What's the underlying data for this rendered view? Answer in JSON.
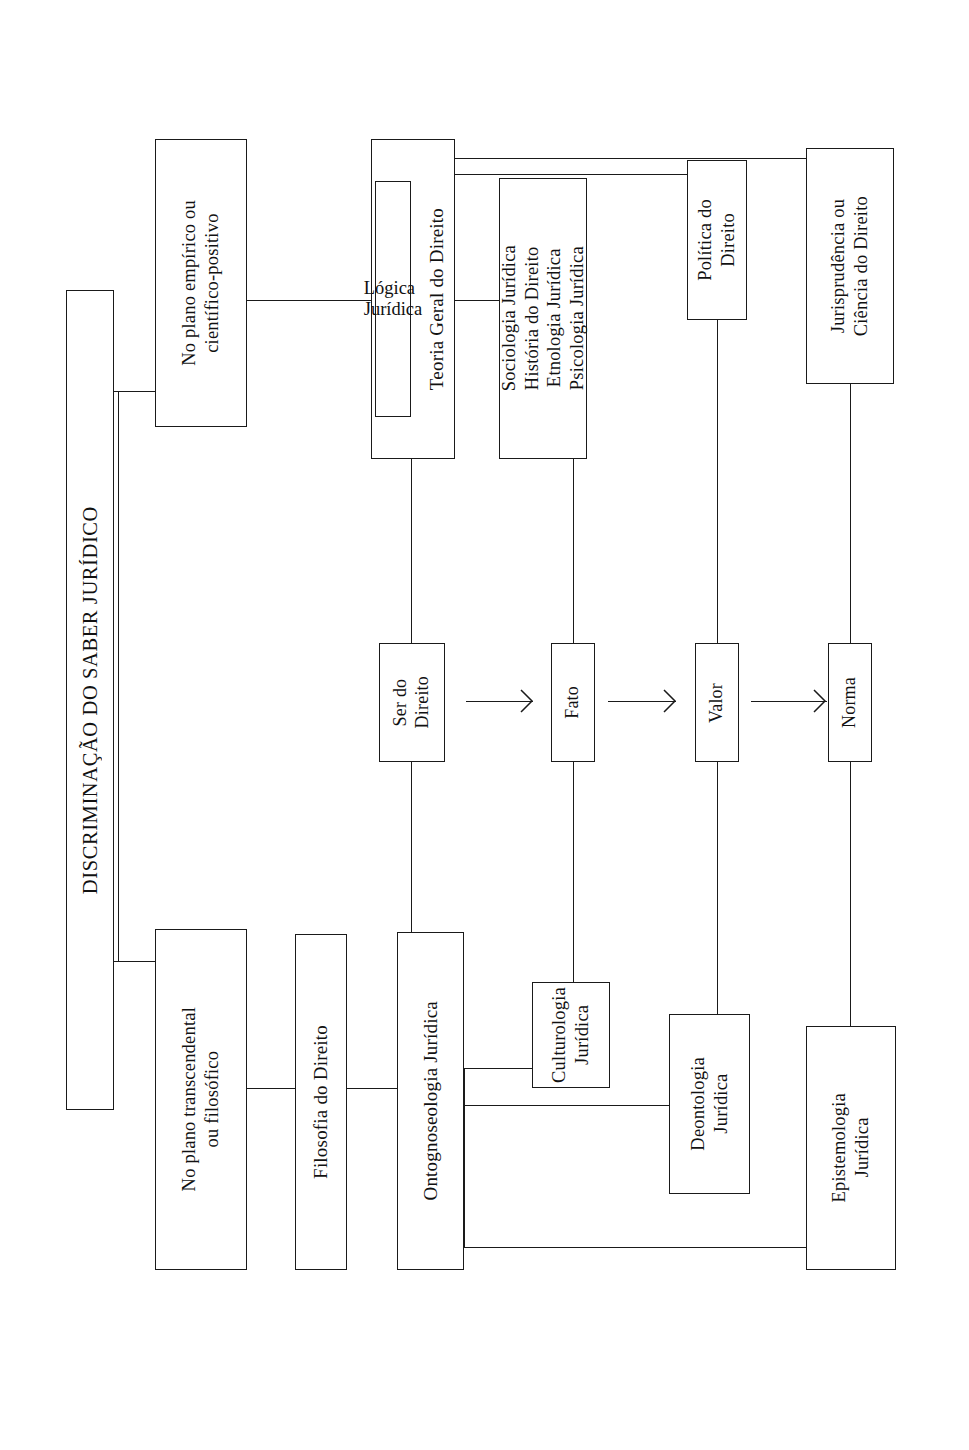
{
  "diagram": {
    "title": "DISCRIMINAÇÃO DO SABER JURÍDICO",
    "orientation": "rotated-90-ccw",
    "nodes": {
      "root": "DISCRIMINAÇÃO DO SABER JURÍDICO",
      "plano_empirico": "No plano empírico ou\ncientífico-positivo",
      "plano_transcendental": "No plano transcendental\nou filosófico",
      "logica_juridica": "Lógica Jurídica",
      "teoria_geral": "Teoria Geral do Direito",
      "ciencias_juridicas": "Sociologia Jurídica\nHistória do Direito\nEtnologia Jurídica\nPsicologia Jurídica",
      "politica_direito": "Política do\nDireito",
      "jurisprudencia": "Jurisprudência ou\nCiência do Direito",
      "filosofia_direito": "Filosofia do Direito",
      "ontognoseologia": "Ontognoseologia Jurídica",
      "culturologia": "Culturologia\nJurídica",
      "deontologia": "Deontologia\nJurídica",
      "epistemologia": "Epistemologia\nJurídica",
      "ser_do_direito": "Ser do\nDireito",
      "fato": "Fato",
      "valor": "Valor",
      "norma": "Norma"
    },
    "chain": {
      "items": [
        "Ser do\nDireito",
        "Fato",
        "Valor",
        "Norma"
      ],
      "arrow_count": 3
    },
    "colors": {
      "stroke": "#1a1a1a",
      "background": "#ffffff",
      "text": "#111111"
    }
  }
}
